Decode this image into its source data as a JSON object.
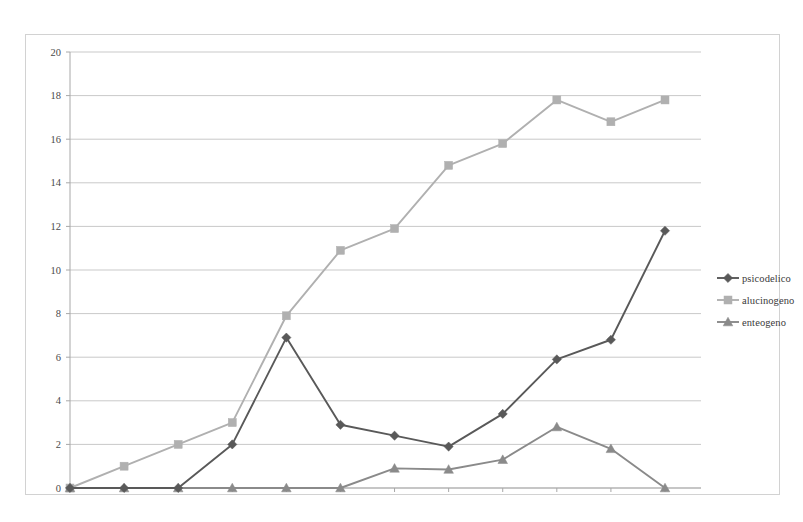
{
  "chart_data": {
    "type": "line",
    "title": "",
    "subtitle": "",
    "xlabel": "",
    "ylabel": "",
    "categories": [
      "1950",
      "1955",
      "1960",
      "1965",
      "1970",
      "1975",
      "1980",
      "1985",
      "1990",
      "1995",
      "2000",
      "2005"
    ],
    "x": [
      1950,
      1955,
      1960,
      1965,
      1970,
      1975,
      1980,
      1985,
      1990,
      1995,
      2000,
      2005
    ],
    "ylim": [
      0,
      20
    ],
    "xlim": [
      1950,
      2005
    ],
    "y_ticks": [
      0,
      2,
      4,
      6,
      8,
      10,
      12,
      14,
      16,
      18,
      20
    ],
    "y_tick_labels": [
      "0",
      "2",
      "4",
      "6",
      "8",
      "10",
      "12",
      "14",
      "16",
      "18",
      "20"
    ],
    "grid": "horizontal",
    "legend_position": "right",
    "series": [
      {
        "name": "psicodelico",
        "marker": "diamond",
        "color": "#595959",
        "values": [
          0,
          0,
          0,
          2.0,
          6.9,
          2.9,
          2.4,
          1.9,
          3.4,
          5.9,
          6.8,
          11.8
        ]
      },
      {
        "name": "alucinogeno",
        "marker": "square",
        "color": "#b0b0b0",
        "values": [
          0,
          1.0,
          2.0,
          3.0,
          7.9,
          10.9,
          11.9,
          14.8,
          15.8,
          17.8,
          16.8,
          17.8
        ]
      },
      {
        "name": "enteogeno",
        "marker": "triangle",
        "color": "#8a8a8a",
        "values": [
          0,
          0,
          0,
          0,
          0,
          0,
          0.9,
          0.85,
          1.3,
          2.8,
          1.8,
          0
        ]
      }
    ]
  },
  "legend": {
    "items": [
      {
        "label": "psicodelico"
      },
      {
        "label": "alucinogeno"
      },
      {
        "label": "enteogeno"
      }
    ]
  },
  "axes": {
    "y_labels": [
      "20",
      "18",
      "16",
      "14",
      "12",
      "10",
      "8",
      "6",
      "4",
      "2",
      "0"
    ],
    "x_labels": [
      "1950",
      "1955",
      "1960",
      "1965",
      "1970",
      "1975",
      "1980",
      "1985",
      "1990",
      "1995",
      "2000",
      "2005"
    ]
  },
  "colors": {
    "series_psicodelico": "#595959",
    "series_alucinogeno": "#b0b0b0",
    "series_enteogeno": "#8a8a8a",
    "gridline": "#c9c9c9",
    "axis": "#a8a8a8",
    "frame": "#d2d2d2",
    "text": "#4a4a4a",
    "background": "#ffffff"
  }
}
